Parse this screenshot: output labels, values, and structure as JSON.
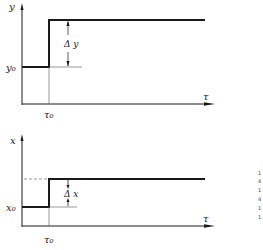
{
  "diagram": {
    "type": "step-response",
    "top_plot": {
      "y_axis_label": "y",
      "x_axis_label": "τ",
      "initial_level_label": "y₀",
      "step_time_label": "τ₀",
      "delta_label": "Δ y"
    },
    "bottom_plot": {
      "y_axis_label": "x",
      "x_axis_label": "τ",
      "initial_level_label": "x₀",
      "step_time_label": "τ₀",
      "delta_label": "Δ x"
    },
    "side_marks": [
      "1",
      "4",
      "1",
      "4",
      "1",
      "1"
    ],
    "colors": {
      "line": "#1a1a1a",
      "thin": "#555555",
      "background": "#ffffff"
    }
  }
}
